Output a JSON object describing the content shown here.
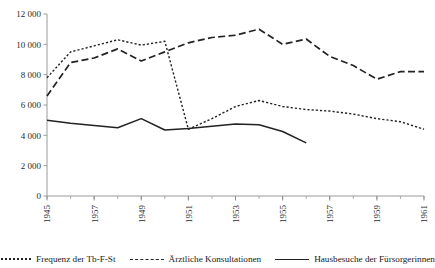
{
  "chart_data": {
    "type": "line",
    "title": "",
    "xlabel": "",
    "ylabel": "",
    "ylim": [
      0,
      12000
    ],
    "yticks": [
      "0",
      "2 000",
      "4 000",
      "6 000",
      "8 000",
      "10 000",
      "12 000"
    ],
    "ytick_values": [
      0,
      2000,
      4000,
      6000,
      8000,
      10000,
      12000
    ],
    "grid": false,
    "legend_position": "bottom",
    "x": [
      1945,
      1946,
      1947,
      1948,
      1949,
      1950,
      1951,
      1952,
      1953,
      1954,
      1955,
      1956,
      1957,
      1958,
      1959,
      1960,
      1961
    ],
    "xtick_labels": [
      "1945",
      "1957",
      "1949",
      "1951",
      "1953",
      "1955",
      "1957",
      "1959",
      "1961"
    ],
    "xtick_values": [
      1945,
      1947,
      1949,
      1951,
      1953,
      1955,
      1957,
      1959,
      1961
    ],
    "series": [
      {
        "name": "Frequenz der Tb-F-St",
        "style": "dotted",
        "color": "#222222",
        "values": [
          7800,
          9500,
          9900,
          10300,
          9950,
          10200,
          4400,
          5100,
          5900,
          6300,
          5900,
          5700,
          5600,
          5400,
          5100,
          4900,
          4400
        ]
      },
      {
        "name": "Ärztliche Konsultationen",
        "style": "dashed",
        "color": "#222222",
        "values": [
          6600,
          8800,
          9100,
          9700,
          8900,
          9500,
          10100,
          10450,
          10600,
          11000,
          10000,
          10350,
          9200,
          8600,
          7700,
          8200,
          8200
        ]
      },
      {
        "name": "Hausbesuche der Fürsorgerinnen",
        "style": "solid",
        "color": "#222222",
        "values": [
          5000,
          4800,
          4650,
          4500,
          5100,
          4350,
          4450,
          4600,
          4750,
          4700,
          4250,
          3500,
          null,
          null,
          null,
          null,
          null
        ]
      }
    ]
  },
  "legend": {
    "items": [
      {
        "label": "Frequenz der Tb-F-St",
        "style": "dotted"
      },
      {
        "label": "Ärztliche Konsultationen",
        "style": "dashed"
      },
      {
        "label": "Hausbesuche der Fürsorgerinnen",
        "style": "solid"
      }
    ]
  }
}
